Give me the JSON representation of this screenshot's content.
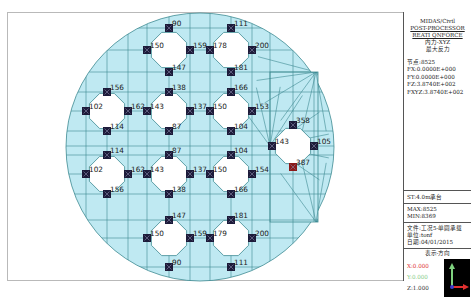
{
  "panel": {
    "title_lines": [
      "MIDAS/Civil",
      "POST-PROCESSOR",
      "REATI QNFORCE",
      "内力-XYZ",
      "最大反力"
    ],
    "node_label": "节点:8525",
    "fx": "FX:0.0000E+000",
    "fy": "FY:0.0000E+000",
    "fz": "FZ:3.8740E+002",
    "fxyz": "FXYZ:3.8740E+002",
    "stage": "ST:4.0m承台",
    "max": "MAX:8525",
    "min": "MIN:8369",
    "file": "文件:工况5-单圆承载",
    "unit": "单位:tonf",
    "date": "日期:04/01/2015",
    "view_direction_label": "表示-方向",
    "x_dir": "X:0.000",
    "y_dir": "Y:0.000",
    "z_dir": "Z:1.000"
  },
  "colors": {
    "mesh_fill": "#bfe9f2",
    "mesh_line": "#3e8a92",
    "marker": "#1d1b3a",
    "max_marker": "#8b1a1a",
    "x_axis": "#e03030",
    "y_axis": "#7fd17f"
  },
  "reactions": [
    {
      "value": "90",
      "x": 169,
      "y": 28,
      "max": false
    },
    {
      "value": "150",
      "x": 147,
      "y": 50,
      "max": false
    },
    {
      "value": "159",
      "x": 190,
      "y": 50,
      "max": false
    },
    {
      "value": "147",
      "x": 169,
      "y": 72,
      "max": false
    },
    {
      "value": "111",
      "x": 231,
      "y": 28,
      "max": false
    },
    {
      "value": "178",
      "x": 210,
      "y": 50,
      "max": false
    },
    {
      "value": "200",
      "x": 252,
      "y": 50,
      "max": false
    },
    {
      "value": "181",
      "x": 231,
      "y": 72,
      "max": false
    },
    {
      "value": "156",
      "x": 107,
      "y": 92,
      "max": false
    },
    {
      "value": "102",
      "x": 86,
      "y": 111,
      "max": false
    },
    {
      "value": "162",
      "x": 128,
      "y": 111,
      "max": false
    },
    {
      "value": "114",
      "x": 107,
      "y": 131,
      "max": false
    },
    {
      "value": "138",
      "x": 169,
      "y": 92,
      "max": false
    },
    {
      "value": "143",
      "x": 147,
      "y": 111,
      "max": false
    },
    {
      "value": "137",
      "x": 190,
      "y": 111,
      "max": false
    },
    {
      "value": "87",
      "x": 169,
      "y": 131,
      "max": false
    },
    {
      "value": "166",
      "x": 231,
      "y": 92,
      "max": false
    },
    {
      "value": "150",
      "x": 210,
      "y": 111,
      "max": false
    },
    {
      "value": "153",
      "x": 252,
      "y": 111,
      "max": false
    },
    {
      "value": "104",
      "x": 231,
      "y": 131,
      "max": false
    },
    {
      "value": "114",
      "x": 107,
      "y": 155,
      "max": false
    },
    {
      "value": "102",
      "x": 86,
      "y": 174,
      "max": false
    },
    {
      "value": "162",
      "x": 128,
      "y": 174,
      "max": false
    },
    {
      "value": "156",
      "x": 107,
      "y": 194,
      "max": false
    },
    {
      "value": "87",
      "x": 169,
      "y": 155,
      "max": false
    },
    {
      "value": "143",
      "x": 147,
      "y": 174,
      "max": false
    },
    {
      "value": "137",
      "x": 190,
      "y": 174,
      "max": false
    },
    {
      "value": "138",
      "x": 169,
      "y": 194,
      "max": false
    },
    {
      "value": "104",
      "x": 231,
      "y": 155,
      "max": false
    },
    {
      "value": "150",
      "x": 210,
      "y": 174,
      "max": false
    },
    {
      "value": "154",
      "x": 252,
      "y": 174,
      "max": false
    },
    {
      "value": "166",
      "x": 231,
      "y": 194,
      "max": false
    },
    {
      "value": "147",
      "x": 169,
      "y": 220,
      "max": false
    },
    {
      "value": "150",
      "x": 147,
      "y": 238,
      "max": false
    },
    {
      "value": "159",
      "x": 190,
      "y": 238,
      "max": false
    },
    {
      "value": "90",
      "x": 169,
      "y": 267,
      "max": false
    },
    {
      "value": "181",
      "x": 231,
      "y": 220,
      "max": false
    },
    {
      "value": "179",
      "x": 210,
      "y": 238,
      "max": false
    },
    {
      "value": "200",
      "x": 252,
      "y": 238,
      "max": false
    },
    {
      "value": "111",
      "x": 231,
      "y": 267,
      "max": false
    },
    {
      "value": "358",
      "x": 293,
      "y": 125,
      "max": false
    },
    {
      "value": "143",
      "x": 272,
      "y": 146,
      "max": false
    },
    {
      "value": "105",
      "x": 314,
      "y": 146,
      "max": false
    },
    {
      "value": "387",
      "x": 293,
      "y": 167,
      "max": true
    }
  ]
}
